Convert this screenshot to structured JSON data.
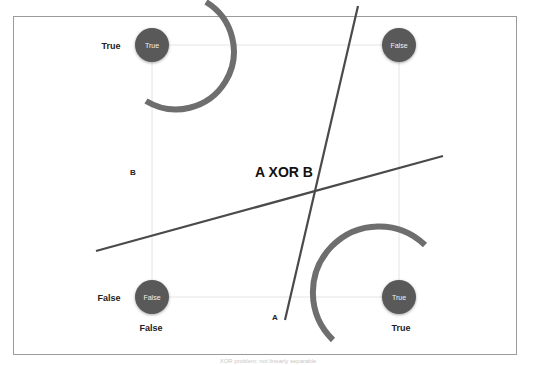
{
  "diagram": {
    "title": "A XOR B",
    "axis_labels": {
      "x": "A",
      "y": "B"
    },
    "row_labels": {
      "top": "True",
      "bottom": "False"
    },
    "column_labels": {
      "left": "False",
      "right": "True"
    },
    "nodes": [
      {
        "id": "tl",
        "label": "True"
      },
      {
        "id": "tr",
        "label": "False"
      },
      {
        "id": "bl",
        "label": "False"
      },
      {
        "id": "br",
        "label": "True"
      }
    ],
    "caption": "XOR problem: not linearly separable",
    "colors": {
      "node": "#595959",
      "arc": "#6e6e6e",
      "line": "#4a4a4a",
      "grid": "#e6e6e6",
      "frame": "#9a9a9a"
    }
  }
}
